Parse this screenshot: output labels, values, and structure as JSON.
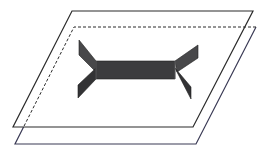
{
  "diagram": {
    "colors": {
      "background": "#ffffff",
      "plane_line": "#2b2b2b",
      "plane_line_lower": "#3a3a55",
      "shape_fill_bar": "#3c3c3e",
      "shape_fill_fin": "#48484a",
      "shape_fill_fin_dark": "#333335",
      "shape_edge": "#1f1f1f"
    },
    "planes": [
      {
        "name": "upper-plane",
        "style": "solid",
        "points": [
          [
            72,
            11
          ],
          [
            253,
            11
          ],
          [
            193,
            127
          ],
          [
            13,
            127
          ]
        ]
      },
      {
        "name": "lower-plane",
        "style": "partially-dashed",
        "points": [
          [
            74,
            27
          ],
          [
            256,
            27
          ],
          [
            196,
            144
          ],
          [
            15,
            144
          ]
        ],
        "hidden_edges": [
          "top",
          "left-upper"
        ]
      }
    ],
    "shape": {
      "name": "h-shaped-solid",
      "bar": [
        [
          96,
          61
        ],
        [
          175,
          61
        ],
        [
          175,
          79
        ],
        [
          96,
          79
        ]
      ],
      "fins": [
        {
          "name": "fin-left-upper",
          "points": [
            [
              79,
              40
            ],
            [
              96,
              61
            ],
            [
              96,
              72
            ],
            [
              79,
              55
            ]
          ]
        },
        {
          "name": "fin-left-lower",
          "points": [
            [
              96,
              68
            ],
            [
              96,
              79
            ],
            [
              78,
              98
            ],
            [
              78,
              85
            ]
          ]
        },
        {
          "name": "fin-right-upper",
          "points": [
            [
              175,
              61
            ],
            [
              198,
              45
            ],
            [
              198,
              58
            ],
            [
              177,
              72
            ]
          ]
        },
        {
          "name": "fin-right-lower",
          "points": [
            [
              175,
              68
            ],
            [
              177,
              72
            ],
            [
              191,
              99
            ],
            [
              191,
              87
            ]
          ]
        }
      ]
    }
  }
}
